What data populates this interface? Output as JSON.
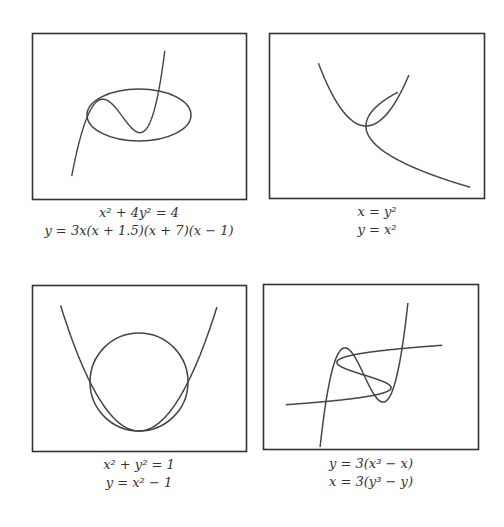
{
  "chart_data": [
    {
      "type": "line",
      "panel": "top-left",
      "title": "",
      "captions": [
        "x² + 4y² = 4",
        "y = 3x(x + 1.5)(x + 7)(x − 1)"
      ],
      "series": [
        {
          "name": "ellipse",
          "equation": "x^2 + 4y^2 = 4"
        },
        {
          "name": "quartic",
          "equation": "y = 3x(x+1.5)(x+7)(x-1)"
        }
      ],
      "axes": "none",
      "grid": false,
      "legend": "none"
    },
    {
      "type": "line",
      "panel": "top-right",
      "captions": [
        "x = y²",
        "y = x²"
      ],
      "series": [
        {
          "name": "sideways-parabola",
          "equation": "x = y^2"
        },
        {
          "name": "parabola",
          "equation": "y = x^2"
        }
      ],
      "axes": "none",
      "grid": false,
      "legend": "none"
    },
    {
      "type": "line",
      "panel": "bottom-left",
      "captions": [
        "x² + y² = 1",
        "y = x² − 1"
      ],
      "series": [
        {
          "name": "circle",
          "equation": "x^2 + y^2 = 1"
        },
        {
          "name": "parabola",
          "equation": "y = x^2 - 1"
        }
      ],
      "axes": "none",
      "grid": false,
      "legend": "none"
    },
    {
      "type": "line",
      "panel": "bottom-right",
      "captions": [
        "y = 3(x³ − x)",
        "x = 3(y³ − y)"
      ],
      "series": [
        {
          "name": "cubic-y",
          "equation": "y = 3(x^3 - x)"
        },
        {
          "name": "cubic-x",
          "equation": "x = 3(y^3 - y)"
        }
      ],
      "axes": "none",
      "grid": false,
      "legend": "none"
    }
  ],
  "panels": [
    {
      "caption1": "x² + 4y² = 4",
      "caption2": "y = 3x(x + 1.5)(x + 7)(x − 1)"
    },
    {
      "caption1": "x = y²",
      "caption2": "y = x²"
    },
    {
      "caption1": "x² + y² = 1",
      "caption2": "y = x² − 1"
    },
    {
      "caption1": "y = 3(x³ − x)",
      "caption2": "x = 3(y³ − y)"
    }
  ],
  "colors": {
    "stroke": "#444444",
    "frame": "#333333",
    "background": "#ffffff"
  }
}
